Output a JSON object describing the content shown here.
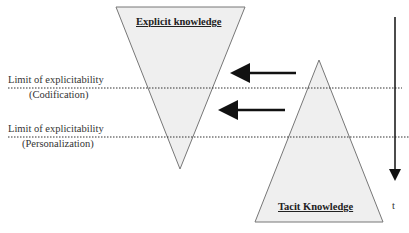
{
  "diagram": {
    "explicit_label": "Explicit knowledge",
    "tacit_label": "Tacit Knowledge",
    "limit1": {
      "line1": "Limit of explicitability",
      "line2": "(Codification)"
    },
    "limit2": {
      "line1": "Limit of explicitability",
      "line2": "(Personalization)"
    },
    "time_label": "t",
    "colors": {
      "fill": "#efefef",
      "stroke": "#777777",
      "arrow": "#111111"
    }
  }
}
